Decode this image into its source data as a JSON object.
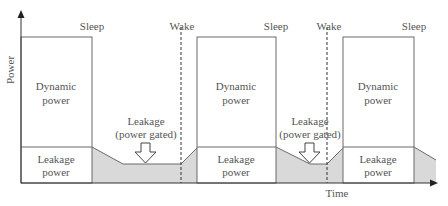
{
  "diagram": {
    "axes": {
      "y_label": "Power",
      "x_label": "Time"
    },
    "events": {
      "sleep_1": "Sleep",
      "wake_1": "Wake",
      "sleep_2": "Sleep",
      "wake_2": "Wake",
      "sleep_3": "Sleep"
    },
    "active_periods": [
      {
        "dynamic_line1": "Dynamic",
        "dynamic_line2": "power",
        "leakage_line1": "Leakage",
        "leakage_line2": "power"
      },
      {
        "dynamic_line1": "Dynamic",
        "dynamic_line2": "power",
        "leakage_line1": "Leakage",
        "leakage_line2": "power"
      },
      {
        "dynamic_line1": "Dynamic",
        "dynamic_line2": "power",
        "leakage_line1": "Leakage",
        "leakage_line2": "power"
      }
    ],
    "gated_periods": [
      {
        "line1": "Leakage",
        "line2": "(power gated)"
      },
      {
        "line1": "Leakage",
        "line2": "(power gated)"
      }
    ],
    "colors": {
      "line": "#6b6b6b",
      "shaded": "#d9d9d9",
      "axis": "#333333"
    }
  }
}
